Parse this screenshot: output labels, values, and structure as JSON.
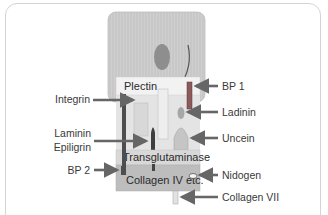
{
  "diagram": {
    "title": "",
    "colors": {
      "cell": "#c9c9c9",
      "nucleus": "#8a8a8a",
      "plectin_band": "#efefef",
      "transglutaminase": "#d6d6d6",
      "collagen_iv": "#bdbdbd",
      "arrow": "#666666",
      "bp1": "#8c5a5a",
      "dark_bar": "#4a4a4a"
    },
    "inner_labels": {
      "plectin": "Plectin",
      "transglutaminase": "Transglutaminase",
      "collagen_iv": "Collagen IV etc."
    },
    "left_labels": {
      "integrin": "Integrin",
      "laminin": "Laminin",
      "epiligrin": "Epiligrin",
      "bp2": "BP 2"
    },
    "right_labels": {
      "bp1": "BP 1",
      "ladinin": "Ladinin",
      "uncein": "Uncein",
      "nidogen": "Nidogen",
      "collagen_vii": "Collagen VII"
    }
  }
}
